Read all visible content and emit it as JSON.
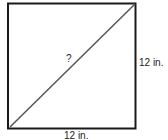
{
  "diagram": {
    "shape": "square",
    "diagonal_label": "?",
    "side_right_label": "12 in.",
    "side_bottom_label": "12 in.",
    "colors": {
      "stroke": "#1a1a1a",
      "diagonal": "#555555",
      "background": "#ffffff"
    }
  }
}
